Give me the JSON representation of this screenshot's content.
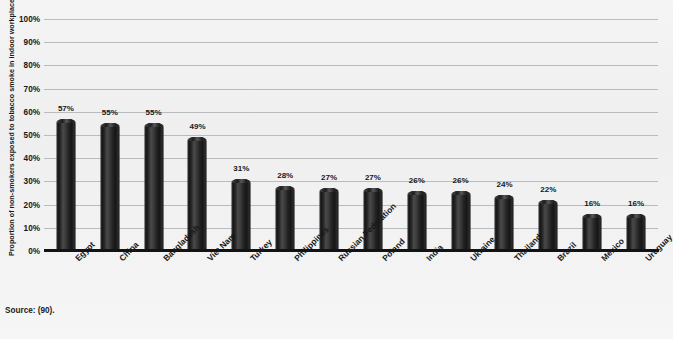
{
  "chart_data": {
    "type": "bar",
    "title": "",
    "xlabel": "",
    "ylabel": "Proportion of non-smokers exposed to tobacco smoke in indoor workplaces",
    "ylim": [
      0,
      100
    ],
    "ytick_labels": [
      "100%",
      "90%",
      "80%",
      "70%",
      "60%",
      "50%",
      "40%",
      "30%",
      "20%",
      "10%",
      "0%"
    ],
    "ytick_values": [
      100,
      90,
      80,
      70,
      60,
      50,
      40,
      30,
      20,
      10,
      0
    ],
    "grid": true,
    "legend": false,
    "unit": "%",
    "categories": [
      "Egypt",
      "China",
      "Bangladesh",
      "Viet Nam",
      "Turkey",
      "Philippines",
      "Russian Federation",
      "Poland",
      "India",
      "Ukraine",
      "Thailand",
      "Brazil",
      "Mexico",
      "Uruguay"
    ],
    "values": [
      57,
      55,
      55,
      49,
      31,
      28,
      27,
      27,
      26,
      26,
      24,
      22,
      16,
      16
    ],
    "value_labels": [
      "57%",
      "55%",
      "55%",
      "49%",
      "31%",
      "28%",
      "27%",
      "27%",
      "26%",
      "26%",
      "24%",
      "22%",
      "16%",
      "16%"
    ],
    "bar_color": "#222222",
    "gridline_color": "#b9bbbd",
    "axis_color": "#111315",
    "background_color": "#f2f2f2"
  },
  "footer": {
    "source": "Source: (90)."
  }
}
